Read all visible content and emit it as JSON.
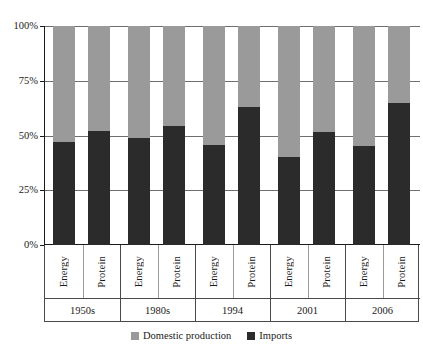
{
  "chart_data": {
    "type": "bar",
    "subtype": "stacked-100-percent",
    "title": "",
    "xlabel": "",
    "ylabel": "",
    "ylim": [
      0,
      100
    ],
    "ytick_labels": [
      "0%",
      "25%",
      "50%",
      "75%",
      "100%"
    ],
    "ytick_values": [
      0,
      25,
      50,
      75,
      100
    ],
    "grid": true,
    "legend_position": "bottom",
    "groups": [
      "1950s",
      "1980s",
      "1994",
      "2001",
      "2006"
    ],
    "subcategories": [
      "Energy",
      "Protein"
    ],
    "categories": [
      "1950s Energy",
      "1950s Protein",
      "1980s Energy",
      "1980s Protein",
      "1994 Energy",
      "1994 Protein",
      "2001 Energy",
      "2001 Protein",
      "2006 Energy",
      "2006 Protein"
    ],
    "series": [
      {
        "name": "Imports",
        "color": "#2b2b2b",
        "values": [
          47,
          52,
          49,
          54.5,
          45.5,
          63,
          40,
          51.5,
          45,
          65
        ]
      },
      {
        "name": "Domestic production",
        "color": "#9a9a9a",
        "values": [
          53,
          48,
          51,
          45.5,
          54.5,
          37,
          60,
          48.5,
          55,
          35
        ]
      }
    ],
    "bars": [
      {
        "group": "1950s",
        "sub": "Energy",
        "imports": 47,
        "domestic": 53
      },
      {
        "group": "1950s",
        "sub": "Protein",
        "imports": 52,
        "domestic": 48
      },
      {
        "group": "1980s",
        "sub": "Energy",
        "imports": 49,
        "domestic": 51
      },
      {
        "group": "1980s",
        "sub": "Protein",
        "imports": 54.5,
        "domestic": 45.5
      },
      {
        "group": "1994",
        "sub": "Energy",
        "imports": 45.5,
        "domestic": 54.5
      },
      {
        "group": "1994",
        "sub": "Protein",
        "imports": 63,
        "domestic": 37
      },
      {
        "group": "2001",
        "sub": "Energy",
        "imports": 40,
        "domestic": 60
      },
      {
        "group": "2001",
        "sub": "Protein",
        "imports": 51.5,
        "domestic": 48.5
      },
      {
        "group": "2006",
        "sub": "Energy",
        "imports": 45,
        "domestic": 55
      },
      {
        "group": "2006",
        "sub": "Protein",
        "imports": 65,
        "domestic": 35
      }
    ]
  },
  "axis": {
    "ticks": [
      {
        "label": "100%",
        "value": 100
      },
      {
        "label": "75%",
        "value": 75
      },
      {
        "label": "50%",
        "value": 50
      },
      {
        "label": "25%",
        "value": 25
      },
      {
        "label": "0%",
        "value": 0
      }
    ]
  },
  "groups": [
    {
      "name": "1950s",
      "series": [
        {
          "label": "Energy"
        },
        {
          "label": "Protein"
        }
      ]
    },
    {
      "name": "1980s",
      "series": [
        {
          "label": "Energy"
        },
        {
          "label": "Protein"
        }
      ]
    },
    {
      "name": "1994",
      "series": [
        {
          "label": "Energy"
        },
        {
          "label": "Protein"
        }
      ]
    },
    {
      "name": "2001",
      "series": [
        {
          "label": "Energy"
        },
        {
          "label": "Protein"
        }
      ]
    },
    {
      "name": "2006",
      "series": [
        {
          "label": "Energy"
        },
        {
          "label": "Protein"
        }
      ]
    }
  ],
  "legend": {
    "items": [
      {
        "label": "Domestic production",
        "color": "#9a9a9a"
      },
      {
        "label": "Imports",
        "color": "#2b2b2b"
      }
    ]
  },
  "colors": {
    "domestic": "#9a9a9a",
    "imports": "#2b2b2b",
    "axis": "#1a1a1a",
    "grid": "#6f6f6f",
    "background": "#ffffff"
  }
}
